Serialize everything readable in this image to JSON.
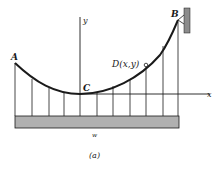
{
  "figure": {
    "caption": "(a)"
  },
  "axes": {
    "x_label": "x",
    "y_label": "y"
  },
  "points": {
    "A": {
      "label": "A"
    },
    "B": {
      "label": "B"
    },
    "C": {
      "label": "C"
    },
    "D": {
      "label": "D(x,y)"
    }
  },
  "deck": {
    "load_label": "w"
  },
  "hangers": {
    "count": 11
  },
  "colors": {
    "ink": "#1a1a1a",
    "deck_fill": "#b0b0b0",
    "wall_fill": "#8c8c8c"
  }
}
